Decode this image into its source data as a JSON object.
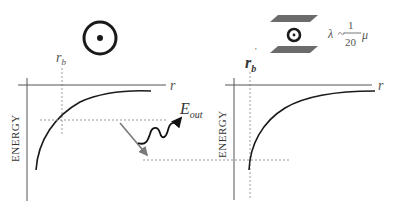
{
  "left_panel": {
    "axis_x_label": "r",
    "axis_y_label": "ENERGY",
    "radius_marker": {
      "base": "r",
      "sub": "b"
    },
    "emission_label": {
      "base": "E",
      "sub": "out"
    },
    "symbol": "free-particle-circle"
  },
  "right_panel": {
    "axis_x_label": "r",
    "axis_y_label": "ENERGY",
    "radius_marker": {
      "base": "r",
      "sub": "b",
      "prime": "'"
    },
    "formula": {
      "lhs": "λ",
      "rel": "~",
      "num": "1",
      "den": "20",
      "rhs": "μ"
    },
    "symbol": "confined-particle-between-plates"
  },
  "colors": {
    "axis": "#555555",
    "curve": "#1a1a1a",
    "dashed": "#9a9a9a",
    "plate": "#6b6b6b",
    "grey_arrow": "#7a7a7a",
    "text": "#333333"
  }
}
